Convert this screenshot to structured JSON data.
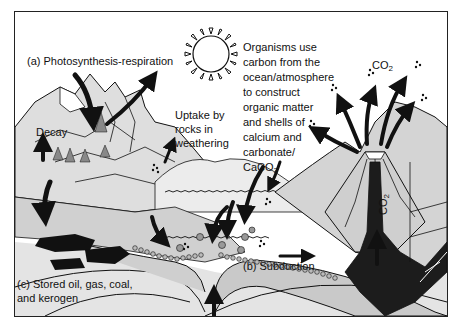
{
  "diagram": {
    "type": "carbon-cycle",
    "labels": {
      "photosynthesis": "(a) Photosynthesis-respiration",
      "decay": "Decay",
      "uptake_line1": "Uptake by",
      "uptake_line2": "rocks in",
      "uptake_line3": "weathering",
      "organisms": [
        "Organisms use",
        "carbon from the",
        "ocean/atmosphere",
        "to construct",
        "organic matter",
        "and shells of",
        "calcium and",
        "carbonate/"
      ],
      "caco3_main": "CaCO",
      "caco3_sub": "3",
      "co2_top_main": "CO",
      "co2_top_sub": "2",
      "co2_vent_main": "CO",
      "co2_vent_sub": "2",
      "subduction": "(b) Subduction",
      "stored_line1": "(c) Stored oil, gas, coal,",
      "stored_line2": "and kerogen"
    },
    "icons": [
      "sun-icon",
      "volcano-icon",
      "arrow-icon",
      "tree-icon",
      "oil-deposit-icon",
      "co2-bubbles-icon",
      "shell-icon"
    ],
    "colors": {
      "ink": "#111111",
      "land_fill": "#d9d9d9",
      "ocean_fill": "#ffffff",
      "crust_fill": "#bdbdbd",
      "magma_fill": "#1a1a1a"
    }
  }
}
